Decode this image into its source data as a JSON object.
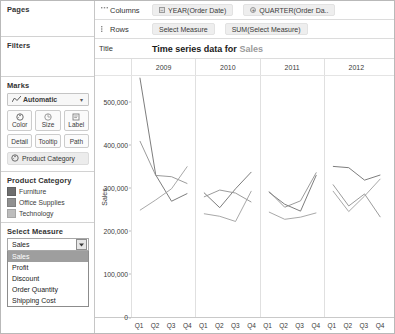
{
  "left_panel": {
    "pages": {
      "title": "Pages"
    },
    "filters": {
      "title": "Filters"
    },
    "marks": {
      "title": "Marks",
      "mark_type": "Automatic",
      "mark_type_icon": "line-chart-icon",
      "caret": "▾",
      "buttons": [
        {
          "label": "Color",
          "icon": "color-palette-icon"
        },
        {
          "label": "Size",
          "icon": "size-circle-icon"
        },
        {
          "label": "Label",
          "icon": "label-tag-icon"
        }
      ],
      "buttons_row2": [
        {
          "label": "Detail",
          "icon": "detail-icon"
        },
        {
          "label": "Tooltip",
          "icon": "tooltip-icon"
        },
        {
          "label": "Path",
          "icon": "path-icon"
        }
      ],
      "mark_pill": {
        "label": "Product Category",
        "icon": "color-palette-icon"
      }
    },
    "legend": {
      "title": "Product Category",
      "items": [
        {
          "label": "Furniture",
          "color": "#6e6e6e"
        },
        {
          "label": "Office Supplies",
          "color": "#909090"
        },
        {
          "label": "Technology",
          "color": "#bdbdbd"
        }
      ]
    },
    "select_measure": {
      "title": "Select Measure",
      "value": "Sales",
      "dropdown_open": true,
      "options": [
        "Sales",
        "Profit",
        "Discount",
        "Order Quantity",
        "Shipping Cost"
      ],
      "selected_index": 0
    }
  },
  "shelves": {
    "columns": {
      "label": "Columns",
      "icon": "columns-icon",
      "pills": [
        {
          "label": "YEAR(Order Date)",
          "icon": "minus-box-icon"
        },
        {
          "label": "QUARTER(Order Da..",
          "icon": "plus-round-icon"
        }
      ]
    },
    "rows": {
      "label": "Rows",
      "icon": "rows-icon",
      "pills": [
        {
          "label": "Select Measure",
          "icon": ""
        },
        {
          "label": "SUM(Select Measure)",
          "icon": ""
        }
      ]
    },
    "title": {
      "label": "Title",
      "text_prefix": "Time series data for",
      "text_measure": "Sales"
    }
  },
  "chart_data": {
    "type": "line",
    "title": "Time series data for Sales",
    "xlabel": "",
    "ylabel": "Sales",
    "ylim": [
      0,
      560000
    ],
    "yticks": [
      0,
      100000,
      200000,
      300000,
      400000,
      500000
    ],
    "ytick_labels": [
      "0",
      "100,000",
      "200,000",
      "300,000",
      "400,000",
      "500,000"
    ],
    "grid": false,
    "legend_position": "left-panel",
    "panel_field": "YEAR(Order Date)",
    "panels": [
      "2009",
      "2010",
      "2011",
      "2012"
    ],
    "x": [
      "Q1",
      "Q2",
      "Q3",
      "Q4"
    ],
    "series": [
      {
        "name": "Furniture",
        "color": "#6e6e6e",
        "values_by_panel": {
          "2009": [
            556000,
            330000,
            269000,
            287000
          ],
          "2010": [
            289000,
            254000,
            298000,
            337000
          ],
          "2011": [
            290000,
            262000,
            246000,
            330000
          ],
          "2012": [
            350000,
            347000,
            318000,
            330000
          ]
        }
      },
      {
        "name": "Office Supplies",
        "color": "#909090",
        "values_by_panel": {
          "2009": [
            409000,
            329000,
            326000,
            310000
          ],
          "2010": [
            279000,
            295000,
            288000,
            267000
          ],
          "2011": [
            292000,
            255000,
            270000,
            336000
          ],
          "2012": [
            308000,
            258000,
            286000,
            232000
          ]
        }
      },
      {
        "name": "Technology",
        "color": "#9e9e9e",
        "values_by_panel": {
          "2009": [
            248000,
            272000,
            298000,
            350000
          ],
          "2010": [
            240000,
            234000,
            222000,
            293000
          ],
          "2011": [
            244000,
            227000,
            232000,
            242000
          ],
          "2012": [
            293000,
            245000,
            281000,
            321000
          ]
        }
      }
    ]
  }
}
